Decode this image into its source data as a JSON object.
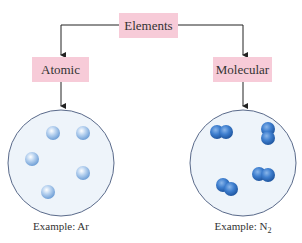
{
  "diagram": {
    "root": {
      "label": "Elements"
    },
    "branches": [
      {
        "label": "Atomic",
        "caption_prefix": "Example: ",
        "caption_formula": "Ar",
        "caption_sub": "",
        "particle_type": "single-atoms",
        "particle_count": 5
      },
      {
        "label": "Molecular",
        "caption_prefix": "Example: ",
        "caption_formula": "N",
        "caption_sub": "2",
        "particle_type": "diatomic-molecules",
        "particle_count": 4
      }
    ],
    "colors": {
      "box_fill": "#f7cbd8",
      "circle_fill": "#eef4fa",
      "circle_stroke": "#5a6a8a",
      "atom_light": "#a9c8ec",
      "molecule_dark": "#3f7fcf",
      "arrow": "#222222"
    }
  }
}
